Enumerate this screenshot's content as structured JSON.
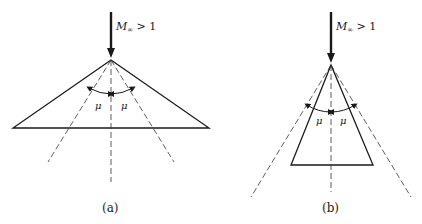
{
  "figure": {
    "panels": [
      {
        "id": "a",
        "caption": "(a)",
        "flow_label_main": "M",
        "flow_label_sub": "∞",
        "flow_label_rest": " > 1",
        "angle_labels": [
          "μ",
          "μ"
        ],
        "description": "Wide wedge (semi-angle larger than Mach angle) with Mach lines inside body"
      },
      {
        "id": "b",
        "caption": "(b)",
        "flow_label_main": "M",
        "flow_label_sub": "∞",
        "flow_label_rest": " > 1",
        "angle_labels": [
          "μ",
          "μ"
        ],
        "description": "Slender cone/wedge (semi-angle smaller than Mach angle) with Mach lines outside body"
      }
    ]
  }
}
